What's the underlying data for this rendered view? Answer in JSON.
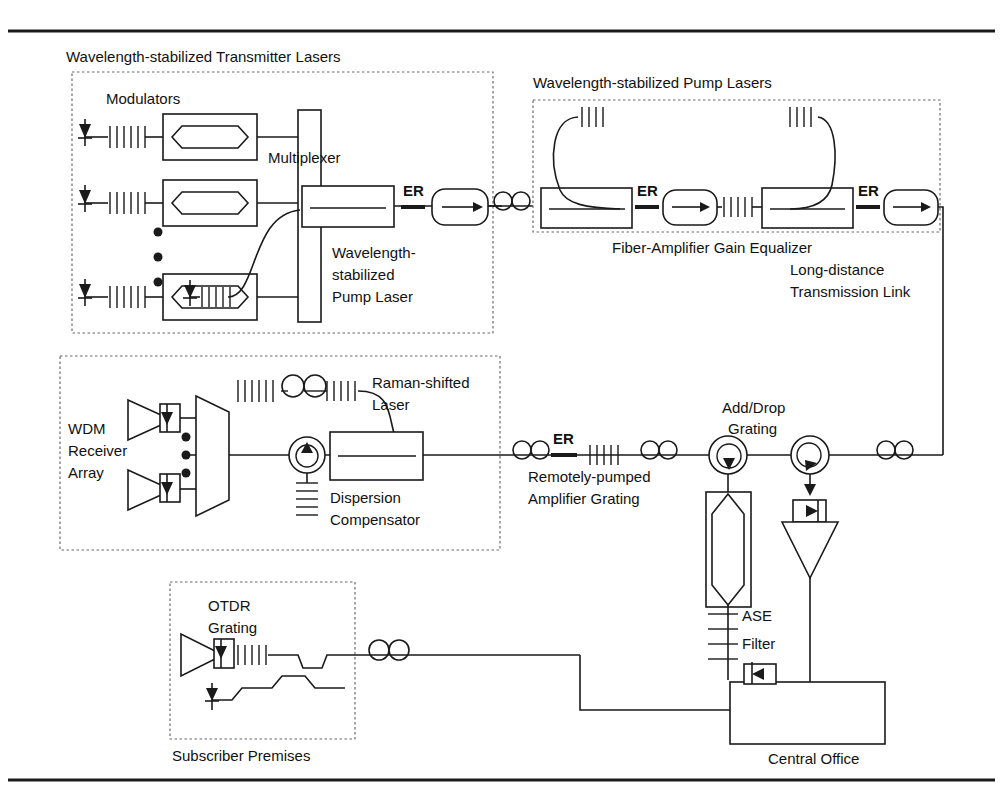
{
  "figure": {
    "type": "block-diagram"
  },
  "labels": {
    "transmitter_lasers": "Wavelength-stabilized Transmitter Lasers",
    "modulators": "Modulators",
    "multiplexer": "Multiplexer",
    "tx_pump_line1": "Wavelength-",
    "tx_pump_line2": "stabilized",
    "tx_pump_line3": "Pump Laser",
    "pump_lasers": "Wavelength-stabilized Pump Lasers",
    "gain_equalizer": "Fiber-Amplifier Gain Equalizer",
    "long_distance_line1": "Long-distance",
    "long_distance_line2": "Transmission Link",
    "wdm_line1": "WDM",
    "wdm_line2": "Receiver",
    "wdm_line3": "Array",
    "raman_line1": "Raman-shifted",
    "raman_line2": "Laser",
    "dispersion_line1": "Dispersion",
    "dispersion_line2": "Compensator",
    "remote_amp_line1": "Remotely-pumped",
    "remote_amp_line2": "Amplifier Grating",
    "add_drop_line1": "Add/Drop",
    "add_drop_line2": "Grating",
    "ase_filter_line1": "ASE",
    "ase_filter_line2": "Filter",
    "otdr_line1": "OTDR",
    "otdr_line2": "Grating",
    "subscriber_premises": "Subscriber Premises",
    "central_office": "Central Office",
    "er_1": "ER",
    "er_2": "ER",
    "er_3": "ER",
    "er_4": "ER"
  },
  "colors": {
    "ink": "#1a1a1a",
    "dash": "#6b6b6b",
    "paper": "#ffffff"
  },
  "components": {
    "modulator_count": 3,
    "vertical_dots_count": 3,
    "receiver_count": 2,
    "isolator_count": 3,
    "circulator_count": 3,
    "er_amplifier_count": 4
  }
}
